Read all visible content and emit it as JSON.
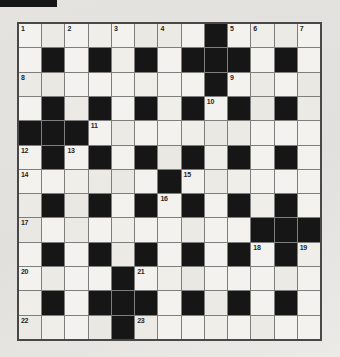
{
  "page": {
    "background": "#e4e3df",
    "scan_artifact_color": "#161616"
  },
  "puzzle": {
    "type": "crossword",
    "rows": 13,
    "cols": 13,
    "grid": [
      "........#....",
      ".#.#.#.###.#.",
      "........#....",
      ".#.#.#.#.#.#.",
      "###..........",
      ".#.#.#.#.#.#.",
      "......#......",
      ".#.#.#.#.#.#.",
      "..........###",
      ".#.#.#.#.#.#.",
      "....#........",
      ".#.###.#.#.#.",
      "....#........"
    ],
    "numbers": [
      {
        "r": 0,
        "c": 0,
        "n": "1"
      },
      {
        "r": 0,
        "c": 2,
        "n": "2"
      },
      {
        "r": 0,
        "c": 4,
        "n": "3"
      },
      {
        "r": 0,
        "c": 6,
        "n": "4"
      },
      {
        "r": 0,
        "c": 9,
        "n": "5"
      },
      {
        "r": 0,
        "c": 10,
        "n": "6"
      },
      {
        "r": 0,
        "c": 12,
        "n": "7"
      },
      {
        "r": 2,
        "c": 0,
        "n": "8"
      },
      {
        "r": 2,
        "c": 9,
        "n": "9"
      },
      {
        "r": 3,
        "c": 8,
        "n": "10"
      },
      {
        "r": 4,
        "c": 3,
        "n": "11"
      },
      {
        "r": 5,
        "c": 0,
        "n": "12"
      },
      {
        "r": 5,
        "c": 2,
        "n": "13"
      },
      {
        "r": 6,
        "c": 0,
        "n": "14"
      },
      {
        "r": 6,
        "c": 7,
        "n": "15"
      },
      {
        "r": 7,
        "c": 6,
        "n": "16"
      },
      {
        "r": 8,
        "c": 0,
        "n": "17"
      },
      {
        "r": 9,
        "c": 10,
        "n": "18"
      },
      {
        "r": 9,
        "c": 12,
        "n": "19"
      },
      {
        "r": 10,
        "c": 0,
        "n": "20"
      },
      {
        "r": 10,
        "c": 5,
        "n": "21"
      },
      {
        "r": 12,
        "c": 0,
        "n": "22"
      },
      {
        "r": 12,
        "c": 5,
        "n": "23"
      }
    ],
    "colors": {
      "black_cell": "#161616",
      "white_cell": "#f3f2ee",
      "grid_line": "#7e7e7e",
      "outer_border": "#484848",
      "number_text": "#262626"
    }
  }
}
